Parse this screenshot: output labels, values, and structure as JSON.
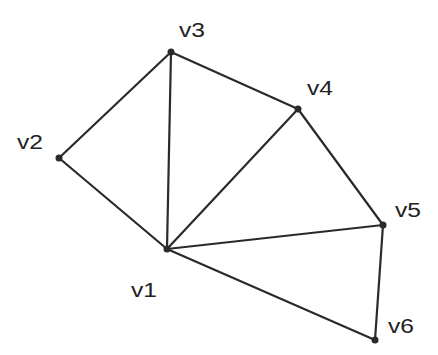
{
  "diagram": {
    "type": "graph",
    "vertices": [
      {
        "id": "v1",
        "label": "v1",
        "x": 167,
        "y": 249,
        "lx": 131,
        "ly": 297
      },
      {
        "id": "v2",
        "label": "v2",
        "x": 59,
        "y": 158,
        "lx": 17,
        "ly": 149
      },
      {
        "id": "v3",
        "label": "v3",
        "x": 171,
        "y": 52,
        "lx": 179,
        "ly": 37
      },
      {
        "id": "v4",
        "label": "v4",
        "x": 298,
        "y": 109,
        "lx": 307,
        "ly": 95
      },
      {
        "id": "v5",
        "label": "v5",
        "x": 383,
        "y": 225,
        "lx": 395,
        "ly": 217
      },
      {
        "id": "v6",
        "label": "v6",
        "x": 375,
        "y": 340,
        "lx": 388,
        "ly": 333
      }
    ],
    "edges": [
      [
        "v1",
        "v2"
      ],
      [
        "v2",
        "v3"
      ],
      [
        "v1",
        "v3"
      ],
      [
        "v3",
        "v4"
      ],
      [
        "v1",
        "v4"
      ],
      [
        "v4",
        "v5"
      ],
      [
        "v1",
        "v5"
      ],
      [
        "v5",
        "v6"
      ],
      [
        "v1",
        "v6"
      ]
    ],
    "colors": {
      "edge": "#2a2a2a",
      "vertex": "#2a2a2a",
      "label": "#222222"
    }
  }
}
